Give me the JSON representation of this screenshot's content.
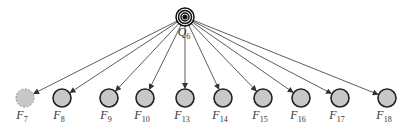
{
  "diagram": {
    "hub": {
      "label": "Q",
      "sub": "6",
      "x": 185,
      "y": 17,
      "r": 9
    },
    "nodes": [
      {
        "label": "F",
        "sub": "7",
        "x": 25,
        "style": "dashed"
      },
      {
        "label": "F",
        "sub": "8",
        "x": 62,
        "style": "solid"
      },
      {
        "label": "F",
        "sub": "9",
        "x": 109,
        "style": "solid"
      },
      {
        "label": "F",
        "sub": "10",
        "x": 145,
        "style": "solid"
      },
      {
        "label": "F",
        "sub": "13",
        "x": 185,
        "style": "solid"
      },
      {
        "label": "F",
        "sub": "14",
        "x": 223,
        "style": "solid"
      },
      {
        "label": "F",
        "sub": "15",
        "x": 263,
        "style": "solid"
      },
      {
        "label": "F",
        "sub": "16",
        "x": 301,
        "style": "solid"
      },
      {
        "label": "F",
        "sub": "17",
        "x": 340,
        "style": "solid"
      },
      {
        "label": "F",
        "sub": "18",
        "x": 387,
        "style": "solid"
      }
    ],
    "node_y": 98,
    "node_r": 9,
    "colors": {
      "fill": "#c8c8c8",
      "stroke": "#222222",
      "edge": "#333333"
    }
  }
}
